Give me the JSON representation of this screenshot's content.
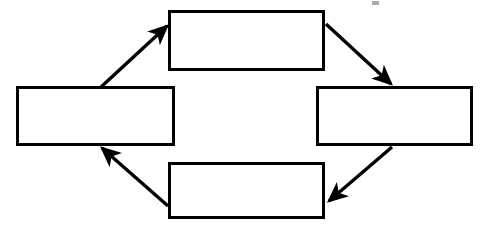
{
  "figure": {
    "type": "cycle-diagram",
    "title": "",
    "background_color": "#ffffff",
    "stroke_color": "#000000",
    "fill_color": "#ffffff",
    "canvas": {
      "width": 486,
      "height": 229
    },
    "direction": "clockwise",
    "nodes": [
      {
        "id": "left",
        "label": "",
        "x": 16,
        "y": 86,
        "width": 159,
        "height": 60,
        "border_width": 3
      },
      {
        "id": "top",
        "label": "",
        "x": 168,
        "y": 10,
        "width": 157,
        "height": 61,
        "border_width": 3
      },
      {
        "id": "right",
        "label": "",
        "x": 316,
        "y": 86,
        "width": 157,
        "height": 60,
        "border_width": 3
      },
      {
        "id": "bottom",
        "label": "",
        "x": 168,
        "y": 162,
        "width": 157,
        "height": 57,
        "border_width": 3
      }
    ],
    "edges": [
      {
        "id": "left-to-top",
        "from": "left",
        "to": "top",
        "x1": 101,
        "y1": 87,
        "x2": 167,
        "y2": 26,
        "arrowhead": "end",
        "stroke_width": 3.4
      },
      {
        "id": "top-to-right",
        "from": "top",
        "to": "right",
        "x1": 326,
        "y1": 24,
        "x2": 391,
        "y2": 84,
        "arrowhead": "end",
        "stroke_width": 3.4
      },
      {
        "id": "right-to-bottom",
        "from": "right",
        "to": "bottom",
        "x1": 392,
        "y1": 147,
        "x2": 329,
        "y2": 201,
        "arrowhead": "end",
        "stroke_width": 3.4
      },
      {
        "id": "bottom-to-left",
        "from": "bottom",
        "to": "left",
        "x1": 168,
        "y1": 206,
        "x2": 102,
        "y2": 148,
        "arrowhead": "end",
        "stroke_width": 3.4
      }
    ],
    "artifacts": [
      {
        "id": "scan-speck-top",
        "x": 372,
        "y": 1,
        "width": 7,
        "height": 4
      }
    ]
  }
}
